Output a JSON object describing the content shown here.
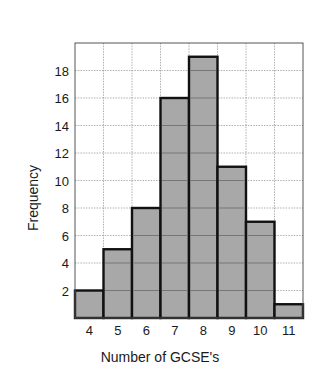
{
  "chart_data": {
    "type": "bar",
    "title": "",
    "xlabel": "Number of GCSE's",
    "ylabel": "Frequency",
    "categories": [
      "4",
      "5",
      "6",
      "7",
      "8",
      "9",
      "10",
      "11"
    ],
    "values": [
      2,
      5,
      8,
      16,
      19,
      11,
      7,
      1
    ],
    "yticks": [
      2,
      4,
      6,
      8,
      10,
      12,
      14,
      16,
      18
    ],
    "ylim": [
      0,
      20
    ],
    "grid": true,
    "legend": null,
    "colors": {
      "bar_fill": "#a8a8a8",
      "bar_edge": "#111111",
      "grid": "#9a9a9a"
    }
  }
}
